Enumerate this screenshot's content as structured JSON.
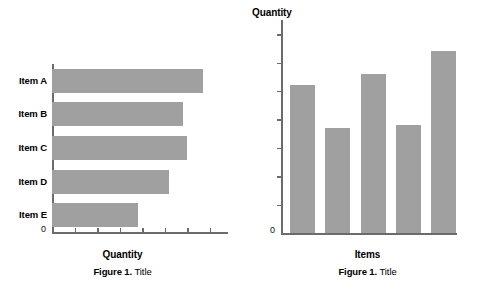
{
  "page": {
    "background": "#ffffff",
    "bar_color": "#a0a0a0",
    "axis_color": "#6b6b6b",
    "text_color": "#000000"
  },
  "figures": [
    {
      "id": "figure-left",
      "caption_label": "Figure 1.",
      "caption_title": "Title",
      "zero_label": "0"
    },
    {
      "id": "figure-right",
      "caption_label": "Figure 1.",
      "caption_title": "Title",
      "zero_label": "0"
    }
  ],
  "chart_data": [
    {
      "type": "bar",
      "orientation": "horizontal",
      "title": "",
      "xlabel": "Quantity",
      "ylabel": "",
      "categories": [
        "Item A",
        "Item B",
        "Item C",
        "Item D",
        "Item E"
      ],
      "values": [
        6.7,
        5.8,
        6.0,
        5.2,
        3.8
      ],
      "xlim": [
        0,
        7.8
      ],
      "ylim": [
        0,
        5
      ],
      "xticks": [
        1,
        2,
        3,
        4,
        5,
        6,
        7
      ],
      "xtick_labels": [
        "",
        "",
        "",
        "",
        "",
        "",
        ""
      ],
      "ytick_labels": [
        "Item A",
        "Item B",
        "Item C",
        "Item D",
        "Item E"
      ],
      "grid": false,
      "legend": false,
      "caption": "Figure 1. Title"
    },
    {
      "type": "bar",
      "orientation": "vertical",
      "title": "",
      "xlabel": "Items",
      "ylabel": "Quantity",
      "categories": [
        "1",
        "2",
        "3",
        "4",
        "5"
      ],
      "values": [
        5.2,
        3.7,
        5.6,
        3.8,
        6.4
      ],
      "xlim": [
        0,
        5
      ],
      "ylim": [
        0,
        7.5
      ],
      "yticks": [
        1,
        2,
        3,
        4,
        5,
        6,
        7
      ],
      "ytick_labels": [
        "",
        "",
        "",
        "",
        "",
        "",
        ""
      ],
      "xtick_labels": [
        "",
        "",
        "",
        "",
        ""
      ],
      "grid": false,
      "legend": false,
      "caption": "Figure 1. Title"
    }
  ],
  "left_chart": {
    "xaxis_title": "Quantity",
    "zero": "0",
    "bars": [
      {
        "label": "Item A",
        "value": 6.7
      },
      {
        "label": "Item B",
        "value": 5.8
      },
      {
        "label": "Item C",
        "value": 6.0
      },
      {
        "label": "Item D",
        "value": 5.2
      },
      {
        "label": "Item E",
        "value": 3.8
      }
    ]
  },
  "right_chart": {
    "xaxis_title": "Items",
    "yaxis_title": "Quantity",
    "zero": "0",
    "bars": [
      {
        "label": "1",
        "value": 5.2
      },
      {
        "label": "2",
        "value": 3.7
      },
      {
        "label": "3",
        "value": 5.6
      },
      {
        "label": "4",
        "value": 3.8
      },
      {
        "label": "5",
        "value": 6.4
      }
    ]
  }
}
